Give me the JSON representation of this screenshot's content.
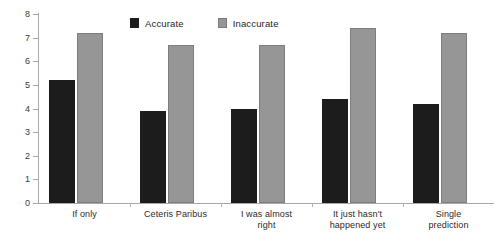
{
  "chart_data": {
    "type": "bar",
    "title": "",
    "subtitle": "",
    "xlabel": "",
    "ylabel": "",
    "ylim": [
      0,
      8
    ],
    "yticks": [
      0,
      1,
      2,
      3,
      4,
      5,
      6,
      7,
      8
    ],
    "grid": false,
    "legend_position": "top-center",
    "categories": [
      "If only",
      "Ceteris Paribus",
      "I was almost right",
      "It just hasn't happened yet",
      "Single prediction"
    ],
    "category_lines": [
      [
        "If only"
      ],
      [
        "Ceteris Paribus"
      ],
      [
        "I was almost",
        "right"
      ],
      [
        "It just hasn't",
        "happened yet"
      ],
      [
        "Single",
        "prediction"
      ]
    ],
    "series": [
      {
        "name": "Accurate",
        "color": "#1c1c1c",
        "values": [
          5.2,
          3.9,
          4.0,
          4.4,
          4.2
        ]
      },
      {
        "name": "Inaccurate",
        "color": "#969696",
        "values": [
          7.2,
          6.7,
          6.7,
          7.4,
          7.2
        ]
      }
    ]
  },
  "legend": {
    "entries": [
      {
        "label": "Accurate",
        "swatch": "legend-swatch-accurate"
      },
      {
        "label": "Inaccurate",
        "swatch": "legend-swatch-inaccurate"
      }
    ]
  },
  "axis": {
    "y_tick_labels": [
      "8",
      "7",
      "6",
      "5",
      "4",
      "3",
      "2",
      "1",
      "0"
    ]
  }
}
